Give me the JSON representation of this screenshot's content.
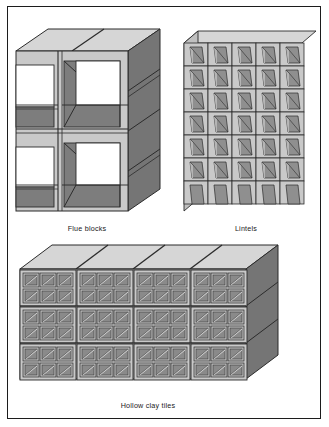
{
  "figure": {
    "panels": [
      {
        "id": "flue-blocks",
        "caption": "Flue blocks"
      },
      {
        "id": "lintels",
        "caption": "Lintels"
      },
      {
        "id": "hollow-clay-tiles",
        "caption": "Hollow clay tiles"
      }
    ]
  },
  "colors": {
    "page_background": "#ffffff",
    "frame_line": "#1c1c1c",
    "face_light": "#c9c9c9",
    "face_top": "#d6d6d6",
    "face_side_dark": "#757575",
    "cavity_shadow": "#8c8c8c",
    "cavity_open": "#ffffff",
    "outline": "#2b2b2b",
    "caption_text": "#1a1a1a"
  },
  "flue_blocks": {
    "label": "Flue blocks",
    "columns": 2,
    "rows": 2,
    "opening_shape": "square",
    "description": "Stacked square-section chimney flue blocks with open square cores"
  },
  "lintels": {
    "label": "Lintels",
    "columns": 5,
    "rows": 7,
    "profile": "U-channel",
    "description": "Stack of U-channel lintel units, open trough facing forward"
  },
  "hollow_clay_tiles": {
    "label": "Hollow clay tiles",
    "columns": 4,
    "rows": 3,
    "cells_per_face_columns": 3,
    "cells_per_face_rows": 2,
    "description": "Stacked structural clay tile units with multiple hollow cells"
  }
}
